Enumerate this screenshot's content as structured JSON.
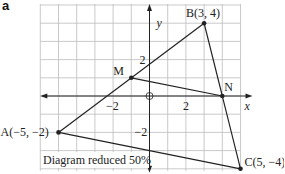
{
  "part_label": "a",
  "caption": "Diagram reduced 50%",
  "axes": {
    "x_label": "x",
    "y_label": "y",
    "origin_symbol": "O",
    "x_ticks": [
      {
        "value": -2,
        "label": "−2"
      },
      {
        "value": 2,
        "label": "2"
      }
    ],
    "y_ticks": [
      {
        "value": 2,
        "label": "2"
      },
      {
        "value": -2,
        "label": "−2"
      }
    ],
    "x_range": [
      -6,
      5
    ],
    "y_range": [
      -4,
      5
    ]
  },
  "points": {
    "A": {
      "label": "A(−5, −2)",
      "x": -5,
      "y": -2
    },
    "B": {
      "label": "B(3, 4)",
      "x": 3,
      "y": 4
    },
    "C": {
      "label": "C(5, −4)",
      "x": 5,
      "y": -4
    },
    "M": {
      "label": "M",
      "x": -1,
      "y": 1
    },
    "N": {
      "label": "N",
      "x": 4,
      "y": 0
    }
  },
  "segments": [
    [
      "A",
      "B"
    ],
    [
      "B",
      "C"
    ],
    [
      "A",
      "C"
    ],
    [
      "M",
      "N"
    ]
  ],
  "colors": {
    "grid": "#bdbdbd",
    "line": "#222222",
    "background": "#ffffff"
  }
}
